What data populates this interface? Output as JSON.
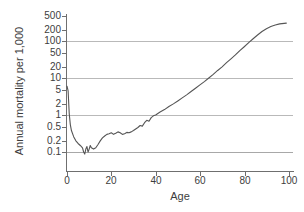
{
  "chart_data": {
    "type": "line",
    "title": "",
    "xlabel": "Age",
    "ylabel": "Annual mortality per 1,000",
    "xlim": [
      0,
      102
    ],
    "ylim": [
      0.07,
      600
    ],
    "yscale": "log",
    "xscale": "linear",
    "grid": true,
    "gridlines_at": [
      100,
      10,
      1,
      0.1
    ],
    "legend": "none",
    "xticks": [
      "0",
      "20",
      "40",
      "60",
      "80",
      "100"
    ],
    "xtick_values": [
      0,
      20,
      40,
      60,
      80,
      100
    ],
    "yticks": [
      "500",
      "200",
      "100",
      "50",
      "20",
      "10",
      "5",
      "2",
      "1",
      "0.5",
      "0.2",
      "0.1"
    ],
    "ytick_values": [
      500,
      200,
      100,
      50,
      20,
      10,
      5,
      2,
      1,
      0.5,
      0.2,
      0.1
    ],
    "line_color": "#555555",
    "grid_color": "#b9b9b9",
    "axis_color": "#6f6f6f",
    "series": [
      {
        "name": "Annual mortality per 1,000",
        "x": [
          0,
          0.5,
          1,
          1.5,
          2,
          3,
          4,
          5,
          6,
          7,
          7.5,
          8,
          8.5,
          9,
          9.5,
          10,
          10.5,
          11,
          12,
          13,
          14,
          15,
          16,
          17,
          18,
          19,
          20,
          21,
          22,
          23,
          24,
          25,
          26,
          27,
          28,
          29,
          30,
          31,
          32,
          33,
          34,
          35,
          36,
          37,
          38,
          39,
          40,
          42,
          44,
          46,
          48,
          50,
          52,
          54,
          56,
          58,
          60,
          62,
          64,
          66,
          68,
          70,
          72,
          74,
          76,
          78,
          80,
          82,
          84,
          86,
          88,
          90,
          92,
          94,
          96,
          98,
          99
        ],
        "y": [
          6.0,
          4.5,
          1.1,
          0.55,
          0.38,
          0.26,
          0.2,
          0.17,
          0.15,
          0.13,
          0.1,
          0.088,
          0.12,
          0.14,
          0.1,
          0.12,
          0.15,
          0.13,
          0.12,
          0.13,
          0.16,
          0.2,
          0.24,
          0.27,
          0.3,
          0.31,
          0.33,
          0.3,
          0.32,
          0.35,
          0.33,
          0.3,
          0.31,
          0.34,
          0.33,
          0.35,
          0.38,
          0.42,
          0.46,
          0.52,
          0.5,
          0.62,
          0.72,
          0.68,
          0.85,
          0.95,
          1.0,
          1.2,
          1.4,
          1.7,
          2.0,
          2.4,
          2.9,
          3.5,
          4.3,
          5.3,
          6.5,
          8.0,
          10.0,
          12.5,
          16.0,
          20.0,
          26.0,
          33.0,
          42.0,
          55.0,
          70.0,
          90.0,
          115.0,
          145.0,
          180.0,
          215.0,
          245.0,
          270.0,
          290.0,
          300.0,
          305.0
        ]
      }
    ]
  }
}
